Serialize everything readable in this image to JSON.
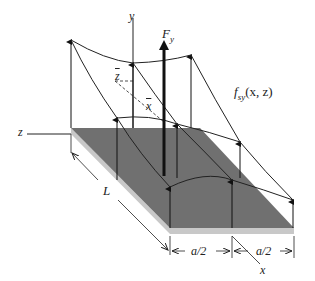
{
  "diagram": {
    "labels": {
      "y_axis": "y",
      "z_axis": "z",
      "x_axis": "x",
      "force": "F",
      "force_sub": "y",
      "func_f": "f",
      "func_sub": "sy",
      "func_args": "(x, z)",
      "zbar": "z",
      "xbar": "x",
      "length": "L",
      "half_a_1": "a/2",
      "half_a_2": "a/2"
    },
    "colors": {
      "plate_top": "#707070",
      "plate_edge": "#c8c8c8",
      "lines": "#222222"
    }
  }
}
